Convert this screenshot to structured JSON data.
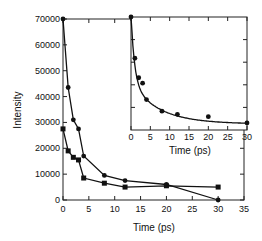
{
  "chart_data": [
    {
      "type": "line",
      "title": "",
      "xlabel": "Time (ps)",
      "ylabel": "Intensity",
      "xlim": [
        0,
        35
      ],
      "ylim": [
        0,
        70000
      ],
      "xticks": [
        "0",
        "5",
        "10",
        "15",
        "20",
        "25",
        "30",
        "35"
      ],
      "yticks": [
        "0",
        "10000",
        "20000",
        "30000",
        "40000",
        "50000",
        "60000",
        "70000"
      ],
      "grid": false,
      "legend": null,
      "series": [
        {
          "name": "circles",
          "marker": "circle",
          "x": [
            0,
            1,
            2,
            3,
            4,
            8,
            12,
            20,
            30
          ],
          "y": [
            70000,
            43500,
            31000,
            27500,
            17000,
            9500,
            7500,
            6000,
            0
          ]
        },
        {
          "name": "squares",
          "marker": "square",
          "x": [
            0,
            1,
            2,
            3,
            4,
            8,
            12,
            20,
            30
          ],
          "y": [
            27500,
            19000,
            16500,
            15500,
            8500,
            6500,
            5000,
            5500,
            5000
          ]
        }
      ]
    },
    {
      "type": "scatter",
      "title": "inset",
      "xlabel": "Time (ps)",
      "ylabel": "",
      "xlim": [
        0,
        30
      ],
      "xticks": [
        "0",
        "5",
        "10",
        "15",
        "20",
        "25",
        "30"
      ],
      "grid": false,
      "series": [
        {
          "name": "circles (fitted decay curve)",
          "marker": "circle",
          "x": [
            0,
            1,
            2,
            3,
            4,
            8,
            12,
            20,
            30
          ],
          "y": [
            70000,
            43500,
            31000,
            27500,
            17000,
            9500,
            7500,
            6000,
            0
          ]
        }
      ]
    }
  ],
  "main": {
    "xlabel": "Time (ps)",
    "ylabel": "Intensity",
    "xticks": [
      "0",
      "5",
      "10",
      "15",
      "20",
      "25",
      "30",
      "35"
    ],
    "yticks": [
      "0",
      "10000",
      "20000",
      "30000",
      "40000",
      "50000",
      "60000",
      "70000"
    ]
  },
  "inset": {
    "xlabel": "Time (ps)",
    "xticks": [
      "0",
      "5",
      "10",
      "15",
      "20",
      "25",
      "30"
    ]
  }
}
